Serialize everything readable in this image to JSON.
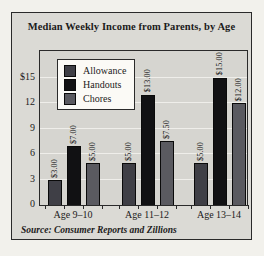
{
  "colors": {
    "page_background": "#f2f1ec",
    "panel_background": "#dbdad5",
    "plot_background": "#d6d5d0",
    "border": "#2a2a2a",
    "gridline": "#efeeea",
    "allowance": "#3f3f46",
    "handouts": "#111113",
    "chores": "#5a5a60"
  },
  "chart_data": {
    "type": "bar",
    "title": "Median Weekly Income from Parents, by Age",
    "source": "Source: Consumer Reports and Zillions",
    "categories": [
      "Age 9–10",
      "Age 11–12",
      "Age 13–14"
    ],
    "series": [
      {
        "name": "Allowance",
        "values": [
          3,
          5,
          5
        ],
        "labels": [
          "$3.00",
          "$5.00",
          "$5.00"
        ],
        "color": "#3f3f46"
      },
      {
        "name": "Handouts",
        "values": [
          7,
          13,
          15
        ],
        "labels": [
          "$7.00",
          "$13.00",
          "$15.00"
        ],
        "color": "#111113"
      },
      {
        "name": "Chores",
        "values": [
          5,
          7.5,
          12
        ],
        "labels": [
          "$5.00",
          "$7.50",
          "$12.00"
        ],
        "color": "#5a5a60"
      }
    ],
    "xlabel": "",
    "ylabel": "",
    "ylim": [
      0,
      15
    ],
    "yticks": [
      {
        "value": 0,
        "label": "0"
      },
      {
        "value": 3,
        "label": "3"
      },
      {
        "value": 6,
        "label": "6"
      },
      {
        "value": 9,
        "label": "9"
      },
      {
        "value": 12,
        "label": "12"
      },
      {
        "value": 15,
        "label": "$15"
      }
    ],
    "grid": true,
    "legend_position": "top-left"
  }
}
